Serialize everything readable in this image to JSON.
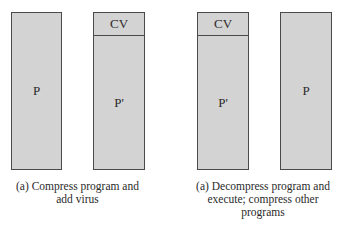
{
  "diagram": {
    "panels": [
      {
        "caption": "(a) Compress program and add virus",
        "caption_lines": [
          "(a) Compress program and",
          "add virus"
        ],
        "boxes": [
          {
            "segments": [
              {
                "label": "P"
              }
            ]
          },
          {
            "segments": [
              {
                "label": "CV"
              },
              {
                "label": "P'"
              }
            ]
          }
        ]
      },
      {
        "caption": "(a) Decompress program and execute; compress other programs",
        "caption_lines": [
          "(a) Decompress program and",
          "execute; compress other",
          "programs"
        ],
        "boxes": [
          {
            "segments": [
              {
                "label": "CV"
              },
              {
                "label": "P'"
              }
            ]
          },
          {
            "segments": [
              {
                "label": "P"
              }
            ]
          }
        ]
      }
    ],
    "colors": {
      "box_fill": "#d3d3d3",
      "box_border": "#4a4a4a",
      "background": "#ffffff"
    }
  }
}
